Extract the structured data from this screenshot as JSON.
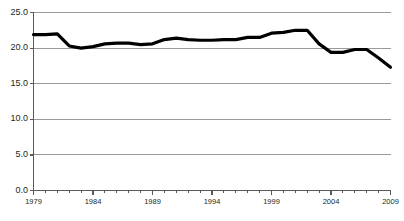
{
  "chart_data": {
    "type": "line",
    "title": "",
    "subtitle": "",
    "xlabel": "",
    "ylabel": "",
    "xlim": [
      1979,
      2009
    ],
    "ylim": [
      0.0,
      25.0
    ],
    "grid": true,
    "legend": false,
    "legend_position": "none",
    "line_color": "#000000",
    "grid_color": "#9a9a9a",
    "axis_color": "#58595b",
    "line_width": 3.2,
    "y_ticks": [
      0.0,
      5.0,
      10.0,
      15.0,
      20.0,
      25.0
    ],
    "y_tick_labels": [
      "0.0",
      "5.0",
      "10.0",
      "15.0",
      "20.0",
      "25.0"
    ],
    "x_ticks": [
      1979,
      1984,
      1989,
      1994,
      1999,
      2004,
      2009
    ],
    "x_tick_labels": [
      "1979",
      "1984",
      "1989",
      "1994",
      "1999",
      "2004",
      "2009"
    ],
    "x_minor_tick_interval": 1,
    "x": [
      1979,
      1980,
      1981,
      1982,
      1983,
      1984,
      1985,
      1986,
      1987,
      1988,
      1989,
      1990,
      1991,
      1992,
      1993,
      1994,
      1995,
      1996,
      1997,
      1998,
      1999,
      2000,
      2001,
      2002,
      2003,
      2004,
      2005,
      2006,
      2007,
      2008,
      2009
    ],
    "series": [
      {
        "name": "value",
        "values": [
          21.9,
          21.9,
          22.0,
          20.3,
          20.0,
          20.2,
          20.6,
          20.7,
          20.7,
          20.5,
          20.6,
          21.2,
          21.4,
          21.2,
          21.1,
          21.1,
          21.2,
          21.2,
          21.5,
          21.5,
          22.1,
          22.2,
          22.5,
          22.5,
          20.6,
          19.4,
          19.4,
          19.8,
          19.8,
          18.6,
          17.3
        ]
      }
    ]
  }
}
